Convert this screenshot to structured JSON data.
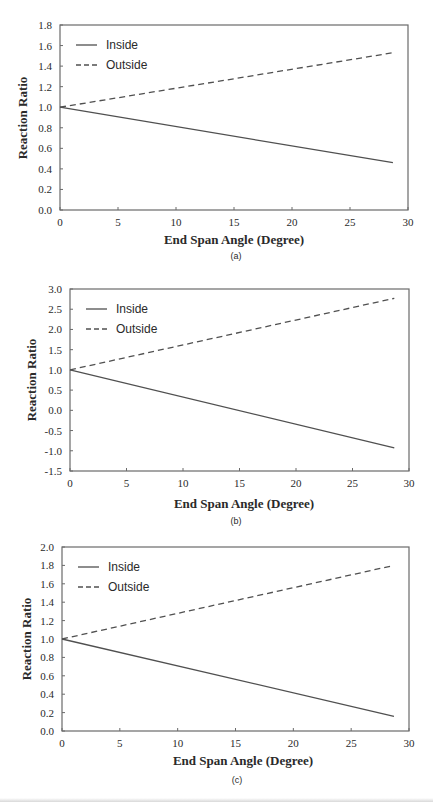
{
  "chart_data": [
    {
      "type": "line",
      "panel_label": "(a)",
      "title": "",
      "xlabel": "End Span Angle (Degree)",
      "ylabel": "Reaction Ratio",
      "xlim": [
        0,
        30
      ],
      "ylim": [
        0.0,
        1.8
      ],
      "xticks": [
        "0",
        "5",
        "10",
        "15",
        "20",
        "25",
        "30"
      ],
      "yticks": [
        "0.0",
        "0.2",
        "0.4",
        "0.6",
        "0.8",
        "1.0",
        "1.2",
        "1.4",
        "1.6",
        "1.8"
      ],
      "grid": false,
      "legend_position": "upper left",
      "series": [
        {
          "name": "Inside",
          "style": "solid",
          "x": [
            0,
            28.7
          ],
          "y": [
            1.0,
            0.46
          ]
        },
        {
          "name": "Outside",
          "style": "dashed",
          "x": [
            0,
            28.7
          ],
          "y": [
            1.0,
            1.53
          ]
        }
      ]
    },
    {
      "type": "line",
      "panel_label": "(b)",
      "title": "",
      "xlabel": "End Span Angle (Degree)",
      "ylabel": "Reaction Ratio",
      "xlim": [
        0,
        30
      ],
      "ylim": [
        -1.5,
        3.0
      ],
      "xticks": [
        "0",
        "5",
        "10",
        "15",
        "20",
        "25",
        "30"
      ],
      "yticks": [
        "-1.5",
        "-1.0",
        "-0.5",
        "0.0",
        "0.5",
        "1.0",
        "1.5",
        "2.0",
        "2.5",
        "3.0"
      ],
      "grid": false,
      "legend_position": "upper left",
      "series": [
        {
          "name": "Inside",
          "style": "solid",
          "x": [
            0,
            28.7
          ],
          "y": [
            1.0,
            -0.93
          ]
        },
        {
          "name": "Outside",
          "style": "dashed",
          "x": [
            0,
            28.7
          ],
          "y": [
            1.0,
            2.77
          ]
        }
      ]
    },
    {
      "type": "line",
      "panel_label": "(c)",
      "title": "",
      "xlabel": "End Span Angle (Degree)",
      "ylabel": "Reaction Ratio",
      "xlim": [
        0,
        30
      ],
      "ylim": [
        0.0,
        2.0
      ],
      "xticks": [
        "0",
        "5",
        "10",
        "15",
        "20",
        "25",
        "30"
      ],
      "yticks": [
        "0.0",
        "0.2",
        "0.4",
        "0.6",
        "0.8",
        "1.0",
        "1.2",
        "1.4",
        "1.6",
        "1.8",
        "2.0"
      ],
      "grid": false,
      "legend_position": "upper left",
      "series": [
        {
          "name": "Inside",
          "style": "solid",
          "x": [
            0,
            28.7
          ],
          "y": [
            1.0,
            0.16
          ]
        },
        {
          "name": "Outside",
          "style": "dashed",
          "x": [
            0,
            28.7
          ],
          "y": [
            1.0,
            1.8
          ]
        }
      ]
    }
  ],
  "colors": {
    "line": "#505050",
    "frame": "#6a6a6a",
    "text": "#2a2a2a"
  }
}
